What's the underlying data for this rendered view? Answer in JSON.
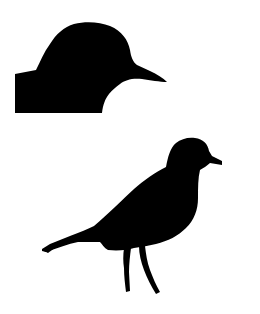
{
  "image": {
    "width": 260,
    "height": 314,
    "background": "#ffffff",
    "fill": "#000000",
    "figures": [
      {
        "id": "head-closeup",
        "description": "Bird head and shoulder silhouette facing right"
      },
      {
        "id": "full-bird",
        "description": "Full standing plover-like bird silhouette facing right"
      }
    ]
  }
}
